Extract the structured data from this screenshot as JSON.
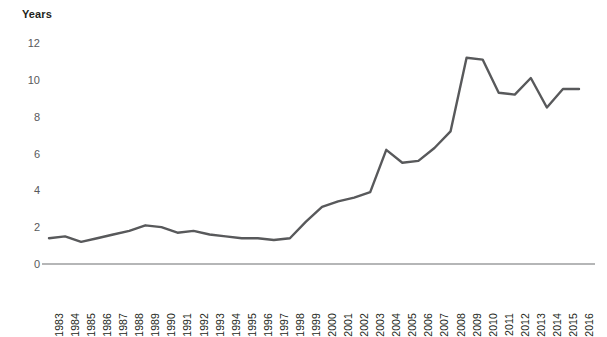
{
  "chart_data": {
    "type": "line",
    "title": "",
    "ylabel": "Years",
    "xlabel": "",
    "ylim": [
      0,
      12
    ],
    "y_ticks": [
      0,
      2,
      4,
      6,
      8,
      10,
      12
    ],
    "grid": false,
    "legend": "none",
    "line_color": "#58595b",
    "axis_color": "#6d6e71",
    "categories": [
      "1983",
      "1984",
      "1985",
      "1986",
      "1987",
      "1988",
      "1989",
      "1990",
      "1991",
      "1992",
      "1993",
      "1994",
      "1995",
      "1996",
      "1997",
      "1998",
      "1999",
      "2000",
      "2001",
      "2002",
      "2003",
      "2004",
      "2005",
      "2006",
      "2007",
      "2008",
      "2009",
      "2010",
      "2011",
      "2012",
      "2013",
      "2014",
      "2015",
      "2016"
    ],
    "values": [
      1.4,
      1.5,
      1.2,
      1.4,
      1.6,
      1.8,
      2.1,
      2.0,
      1.7,
      1.8,
      1.6,
      1.5,
      1.4,
      1.4,
      1.3,
      1.4,
      2.3,
      3.1,
      3.4,
      3.6,
      3.9,
      6.2,
      5.5,
      5.6,
      6.3,
      7.2,
      11.2,
      11.1,
      9.3,
      9.2,
      10.1,
      8.5,
      9.5,
      9.5
    ],
    "series": [
      {
        "name": "Years",
        "values": [
          1.4,
          1.5,
          1.2,
          1.4,
          1.6,
          1.8,
          2.1,
          2.0,
          1.7,
          1.8,
          1.6,
          1.5,
          1.4,
          1.4,
          1.3,
          1.4,
          2.3,
          3.1,
          3.4,
          3.6,
          3.9,
          6.2,
          5.5,
          5.6,
          6.3,
          7.2,
          11.2,
          11.1,
          9.3,
          9.2,
          10.1,
          8.5,
          9.5,
          9.5
        ]
      }
    ]
  },
  "axis": {
    "y_title": "Years"
  }
}
